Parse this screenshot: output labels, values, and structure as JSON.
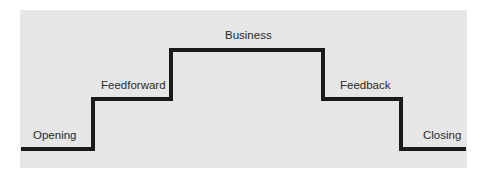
{
  "diagram": {
    "type": "step-profile",
    "colors": {
      "background": "#ffffff",
      "panel": "#e6e6e6",
      "line": "#1a1a1a",
      "text": "#2a2a2a"
    },
    "stages": [
      {
        "label": "Opening",
        "level": 0
      },
      {
        "label": "Feedforward",
        "level": 1
      },
      {
        "label": "Business",
        "level": 2
      },
      {
        "label": "Feedback",
        "level": 1
      },
      {
        "label": "Closing",
        "level": 0
      }
    ]
  }
}
